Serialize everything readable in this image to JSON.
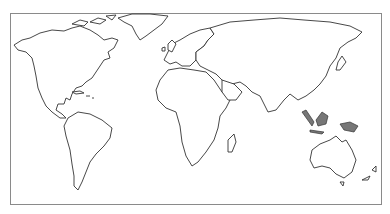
{
  "map": {
    "type": "world-outline",
    "projection": "equirectangular-like",
    "colors": {
      "outline": "#333333",
      "frame": "#8a8a8a",
      "shaded_islands": "#777777",
      "background": "#ffffff"
    },
    "regions": [
      "North America",
      "Greenland",
      "South America",
      "Europe",
      "Africa",
      "Asia",
      "Indonesia",
      "Australia",
      "New Zealand",
      "Madagascar"
    ]
  }
}
